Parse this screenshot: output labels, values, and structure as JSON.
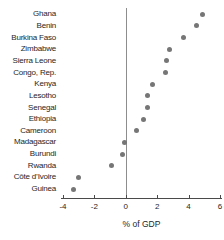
{
  "chart": {
    "x_axis_title": "% of GDP",
    "colors": {
      "dot": "#767676",
      "axis": "#4a4a4a",
      "zero_line": "#8d8d8d",
      "text": "#262626",
      "background": "#ffffff"
    }
  },
  "chart_data": {
    "type": "scatter",
    "subtype": "horizontal-dot-plot",
    "categories": [
      "Ghana",
      "Benin",
      "Burkina Faso",
      "Zimbabwe",
      "Sierra Leone",
      "Congo, Rep.",
      "Kenya",
      "Lesotho",
      "Senegal",
      "Ethiopia",
      "Cameroon",
      "Madagascar",
      "Burundi",
      "Rwanda",
      "Côte d’Ivoire",
      "Guinea"
    ],
    "values": [
      4.9,
      4.5,
      3.7,
      2.8,
      2.6,
      2.5,
      1.7,
      1.4,
      1.4,
      1.1,
      0.7,
      -0.1,
      -0.2,
      -0.9,
      -3.0,
      -3.3
    ],
    "xlabel": "% of GDP",
    "xlim": [
      -4,
      6
    ],
    "xticks": [
      -4,
      -2,
      0,
      2,
      4,
      6
    ],
    "zero_reference_line": true,
    "grid": false,
    "legend": false
  }
}
